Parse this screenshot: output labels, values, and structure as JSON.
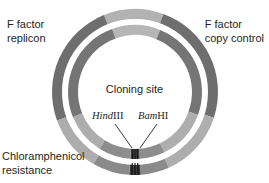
{
  "figure": {
    "type": "circular-plasmid-map",
    "center": {
      "x": 135,
      "y": 92
    },
    "radii": {
      "outer_band_outer": 83,
      "outer_band_inner": 71,
      "gap_outer": 71,
      "gap_inner": 67,
      "inner_band_outer": 67,
      "inner_band_inner": 57
    },
    "background_color": "#ffffff"
  },
  "labels": {
    "f_factor_replicon": "F factor\nreplicon",
    "f_factor_replicon_line1": "F factor",
    "f_factor_replicon_line2": "replicon",
    "f_factor_copy_control_line1": "F factor",
    "f_factor_copy_control_line2": "copy control",
    "chloramphenicol_resistance_line1": "Chloramphenicol",
    "chloramphenicol_resistance_line2": "resistance",
    "cloning_site": "Cloning site"
  },
  "restriction_sites": [
    {
      "id": "hindiii",
      "italic_part": "Hind",
      "roman_part": "III",
      "full": "HindIII",
      "angle_deg": 87,
      "leader_from": {
        "x": 115,
        "y": 124
      },
      "leader_to": {
        "x": 132,
        "y": 148
      }
    },
    {
      "id": "bamhi",
      "italic_part": "Bam",
      "roman_part": "HI",
      "full": "BamHI",
      "angle_deg": 93,
      "leader_from": {
        "x": 157,
        "y": 124
      },
      "leader_to": {
        "x": 140,
        "y": 148
      }
    }
  ],
  "colors": {
    "dark_gray": "#6e6e6e",
    "medium_gray": "#808080",
    "mid_light_gray": "#919191",
    "light_gray": "#a3a3a3",
    "lighter_gray": "#b2b2b2",
    "pale_gray": "#bdbdbd",
    "cloning_band_dark": "#4a4a4a",
    "cloning_band_black": "#1a1a1a",
    "gap_white": "#ffffff",
    "text_color": "#231f20"
  },
  "ring_segments": {
    "outer_band": [
      {
        "name": "top-light-arc",
        "start_deg": -112,
        "end_deg": -70,
        "color": "#b2b2b2"
      },
      {
        "name": "upper-right-dark",
        "start_deg": -70,
        "end_deg": 18,
        "color": "#6e6e6e"
      },
      {
        "name": "right-light",
        "start_deg": 18,
        "end_deg": 66,
        "color": "#aeaeae"
      },
      {
        "name": "bottom-right-medium",
        "start_deg": 66,
        "end_deg": 86,
        "color": "#8a8a8a"
      },
      {
        "name": "cloning-site-band",
        "start_deg": 86,
        "end_deg": 94,
        "color": "#3d3d3d"
      },
      {
        "name": "bottom-left-medium",
        "start_deg": 94,
        "end_deg": 120,
        "color": "#8a8a8a"
      },
      {
        "name": "left-light",
        "start_deg": 120,
        "end_deg": 160,
        "color": "#adadad"
      },
      {
        "name": "upper-left-dark",
        "start_deg": 160,
        "end_deg": 248,
        "color": "#6e6e6e"
      }
    ],
    "inner_band": [
      {
        "name": "top-light-arc",
        "start_deg": -110,
        "end_deg": -68,
        "color": "#b6b6b6"
      },
      {
        "name": "upper-right-dark",
        "start_deg": -68,
        "end_deg": 20,
        "color": "#757575"
      },
      {
        "name": "right-light",
        "start_deg": 20,
        "end_deg": 64,
        "color": "#aeaeae"
      },
      {
        "name": "bottom-right-medium",
        "start_deg": 64,
        "end_deg": 86,
        "color": "#8d8d8d"
      },
      {
        "name": "cloning-site-band",
        "start_deg": 86,
        "end_deg": 94,
        "color": "#3d3d3d"
      },
      {
        "name": "bottom-left-medium",
        "start_deg": 94,
        "end_deg": 122,
        "color": "#8d8d8d"
      },
      {
        "name": "left-light",
        "start_deg": 122,
        "end_deg": 158,
        "color": "#adadad"
      },
      {
        "name": "upper-left-dark",
        "start_deg": 158,
        "end_deg": 250,
        "color": "#757575"
      }
    ],
    "cloning_site_stripes": [
      {
        "offset_deg": -2.2,
        "width_deg": 0.9,
        "color": "#111111"
      },
      {
        "offset_deg": 0.0,
        "width_deg": 0.9,
        "color": "#111111"
      },
      {
        "offset_deg": 2.2,
        "width_deg": 0.9,
        "color": "#111111"
      }
    ]
  }
}
